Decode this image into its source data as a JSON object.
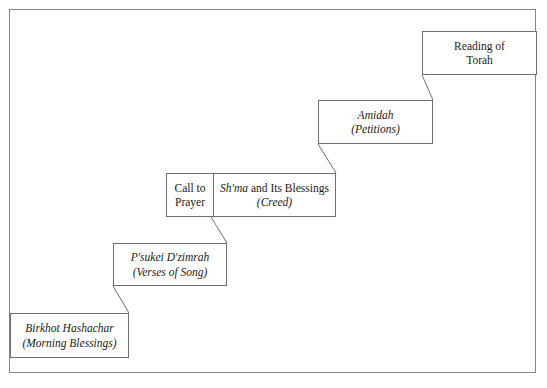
{
  "diagram": {
    "type": "staircase-flow",
    "frame_color": "#888888",
    "box_border_color": "#6f6f6f",
    "text_color": "#1a1a1a",
    "background": "#ffffff",
    "steps": [
      {
        "id": "birkhot-hashachar",
        "order": 1,
        "cells": [
          {
            "lines": [
              {
                "text": "Birkhot Hashachar",
                "style": "italic"
              },
              {
                "text": "(Morning Blessings)",
                "style": "italic"
              }
            ]
          }
        ]
      },
      {
        "id": "psukei-dzimrah",
        "order": 2,
        "cells": [
          {
            "lines": [
              {
                "text": "P'sukei D'zimrah",
                "style": "italic"
              },
              {
                "text": "(Verses of Song)",
                "style": "italic"
              }
            ]
          }
        ]
      },
      {
        "id": "shma-and-its-blessings",
        "order": 3,
        "cells": [
          {
            "id": "call-to-prayer",
            "lines": [
              {
                "text": "Call to",
                "style": "roman"
              },
              {
                "text": "Prayer",
                "style": "roman"
              }
            ]
          },
          {
            "id": "shma-creed",
            "lines": [
              {
                "text": "Sh'ma and Its Blessings",
                "style": "mixed",
                "italic_part": "Sh'ma",
                "roman_part": " and Its Blessings"
              },
              {
                "text": "(Creed)",
                "style": "italic"
              }
            ]
          }
        ]
      },
      {
        "id": "amidah",
        "order": 4,
        "cells": [
          {
            "lines": [
              {
                "text": "Amidah",
                "style": "italic"
              },
              {
                "text": "(Petitions)",
                "style": "italic"
              }
            ]
          }
        ]
      },
      {
        "id": "reading-of-torah",
        "order": 5,
        "cells": [
          {
            "lines": [
              {
                "text": "Reading of",
                "style": "roman"
              },
              {
                "text": "Torah",
                "style": "roman"
              }
            ]
          }
        ]
      }
    ],
    "connectors": [
      {
        "from": "birkhot-hashachar",
        "to": "psukei-dzimrah"
      },
      {
        "from": "psukei-dzimrah",
        "to": "shma-and-its-blessings"
      },
      {
        "from": "shma-and-its-blessings",
        "to": "amidah"
      },
      {
        "from": "amidah",
        "to": "reading-of-torah"
      }
    ]
  }
}
